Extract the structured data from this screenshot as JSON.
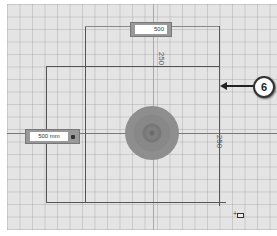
{
  "viewport": {
    "dimension_width_input": {
      "value": "500"
    },
    "dimension_height_input": {
      "value": "500 mm"
    },
    "top_dimension_label": "250",
    "right_dimension_label": "250",
    "callout_number": "6",
    "cursor_icon": "rectangle-cursor-icon"
  },
  "colors": {
    "grid_bg": "#e4e4e4",
    "circle": "#8a8a8a",
    "lines": "#555555"
  }
}
